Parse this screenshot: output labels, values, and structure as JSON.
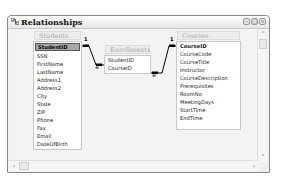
{
  "window": {
    "title": "Relationships",
    "icon": "relationships-icon",
    "buttons": {
      "minimize": "–",
      "maximize": "□",
      "close": "×"
    }
  },
  "tables": {
    "students": {
      "name": "Students",
      "fields": [
        "StudentID",
        "SSN",
        "FirstName",
        "LastName",
        "Address1",
        "Address2",
        "City",
        "State",
        "ZIP",
        "Phone",
        "Fax",
        "Email",
        "DateOfBirth"
      ],
      "primary_key": "StudentID",
      "selected": "StudentID"
    },
    "enrollments": {
      "name": "Enrollments",
      "fields": [
        "StudentID",
        "CourseID"
      ]
    },
    "courses": {
      "name": "Courses",
      "fields": [
        "CourseID",
        "CourseCode",
        "CourseTitle",
        "Instructor",
        "CourseDescription",
        "Prerequisites",
        "RoomNo",
        "MeetingDays",
        "StartTime",
        "EndTime"
      ],
      "primary_key": "CourseID"
    }
  },
  "relationships": [
    {
      "from": "Students.StudentID",
      "to": "Enrollments.StudentID",
      "one_label": "1",
      "many_label": "∞"
    },
    {
      "from": "Courses.CourseID",
      "to": "Enrollments.CourseID",
      "one_label": "1",
      "many_label": "∞"
    }
  ],
  "scrollbars": {
    "up": "˄",
    "down": "˅",
    "left": "‹",
    "right": "›"
  }
}
